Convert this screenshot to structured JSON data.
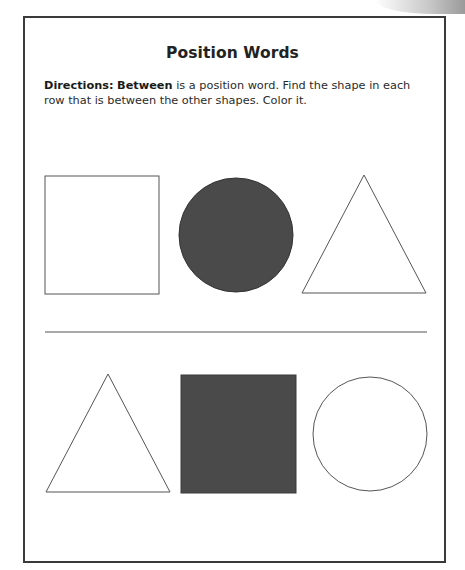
{
  "worksheet": {
    "title": "Position Words",
    "directions": {
      "label": "Directions:",
      "keyword": "Between",
      "text": " is a position word. Find the shape in each row that is between the other shapes. Color it."
    },
    "colors": {
      "border": "#3a3a3a",
      "outline": "#555555",
      "filled_shape": "#4a4a4a",
      "background": "#ffffff"
    },
    "rows": [
      {
        "shapes": [
          {
            "type": "square",
            "position": "left",
            "filled": false
          },
          {
            "type": "circle",
            "position": "middle",
            "filled": true
          },
          {
            "type": "triangle",
            "position": "right",
            "filled": false
          }
        ]
      },
      {
        "shapes": [
          {
            "type": "triangle",
            "position": "left",
            "filled": false
          },
          {
            "type": "square",
            "position": "middle",
            "filled": true
          },
          {
            "type": "circle",
            "position": "right",
            "filled": false
          }
        ]
      }
    ]
  }
}
